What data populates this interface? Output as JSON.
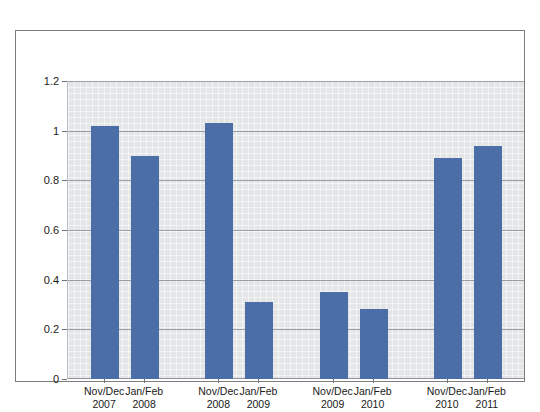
{
  "chart_data": {
    "type": "bar",
    "title": "",
    "subtitle": "",
    "xlabel": "",
    "ylabel": "",
    "legend": [],
    "legend_position": "none",
    "grid": true,
    "ylim": [
      0,
      1.2
    ],
    "ytick_values": [
      0,
      0.2,
      0.4,
      0.6,
      0.8,
      1,
      1.2
    ],
    "ytick_labels": [
      "0",
      "0.2",
      "0.4",
      "0.6",
      "0.8",
      "1",
      "1.2"
    ],
    "categories": [
      "Nov/Dec 2007",
      "Jan/Feb 2008",
      "Nov/Dec 2008",
      "Jan/Feb 2009",
      "Nov/Dec 2009",
      "Jan/Feb 2010",
      "Nov/Dec 2010",
      "Jan/Feb 2011"
    ],
    "category_lines": [
      {
        "top": "Nov/Dec",
        "bottom": "2007"
      },
      {
        "top": "Jan/Feb",
        "bottom": "2008"
      },
      {
        "top": "Nov/Dec",
        "bottom": "2008"
      },
      {
        "top": "Jan/Feb",
        "bottom": "2009"
      },
      {
        "top": "Nov/Dec",
        "bottom": "2009"
      },
      {
        "top": "Jan/Feb",
        "bottom": "2010"
      },
      {
        "top": "Nov/Dec",
        "bottom": "2010"
      },
      {
        "top": "Jan/Feb",
        "bottom": "2011"
      }
    ],
    "values": [
      1.02,
      0.9,
      1.03,
      0.31,
      0.35,
      0.28,
      0.89,
      0.94
    ],
    "groups": [
      {
        "label": "2007/2008",
        "indices": [
          0,
          1
        ]
      },
      {
        "label": "2008/2009",
        "indices": [
          2,
          3
        ]
      },
      {
        "label": "2009/2010",
        "indices": [
          4,
          5
        ]
      },
      {
        "label": "2010/2011",
        "indices": [
          6,
          7
        ]
      }
    ],
    "colors": {
      "bar": "#4a6ea5",
      "plot_background": "#e3e5e7",
      "gridline": "#9aa0a6",
      "frame": "#7d7d7d",
      "figure_background": "#ffffff",
      "text": "#1a1a1a"
    }
  }
}
